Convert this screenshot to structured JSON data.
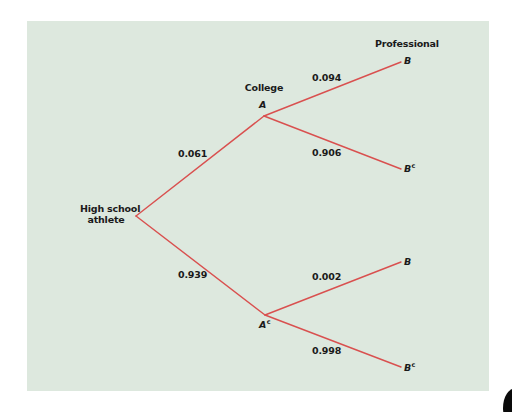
{
  "diagram": {
    "type": "probability-tree",
    "colors": {
      "background": "#dde8de",
      "branch": "#d9504f",
      "text": "#1a1a1a"
    },
    "stage_labels": {
      "root": "High school athlete",
      "root_line1": "High school",
      "root_line2": "athlete",
      "level1": "College",
      "level2": "Professional"
    },
    "nodes": {
      "A": {
        "letter": "A",
        "sup": ""
      },
      "Ac": {
        "letter": "A",
        "sup": "c"
      },
      "B_top": {
        "letter": "B",
        "sup": ""
      },
      "Bc_top": {
        "letter": "B",
        "sup": "c"
      },
      "B_bottom": {
        "letter": "B",
        "sup": ""
      },
      "Bc_bottom": {
        "letter": "B",
        "sup": "c"
      }
    },
    "branches": [
      {
        "from": "root",
        "to": "A",
        "probability": "0.061"
      },
      {
        "from": "root",
        "to": "Ac",
        "probability": "0.939"
      },
      {
        "from": "A",
        "to": "B_top",
        "probability": "0.094"
      },
      {
        "from": "A",
        "to": "Bc_top",
        "probability": "0.906"
      },
      {
        "from": "Ac",
        "to": "B_bottom",
        "probability": "0.002"
      },
      {
        "from": "Ac",
        "to": "Bc_bottom",
        "probability": "0.998"
      }
    ]
  }
}
